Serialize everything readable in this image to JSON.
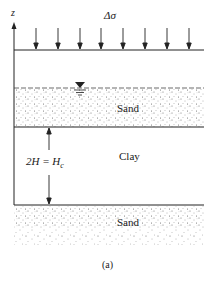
{
  "diagram": {
    "axis_label": "z",
    "load_label": "Δσ",
    "layers": [
      {
        "name": "upper-sand",
        "label": "Sand"
      },
      {
        "name": "clay",
        "label": "Clay"
      },
      {
        "name": "lower-sand",
        "label": "Sand"
      }
    ],
    "thickness_label": "2H = H",
    "thickness_subscript": "c",
    "water_table_symbol": "▼",
    "caption": "(a)",
    "load_arrow_count": 8
  }
}
